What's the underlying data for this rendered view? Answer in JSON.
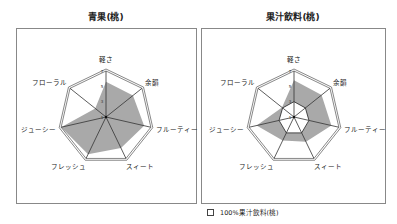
{
  "chart_data": [
    {
      "type": "radar",
      "title": "青果(桃)",
      "axes": [
        "軽さ",
        "余韻",
        "フルーティー",
        "スィート",
        "フレッシュ",
        "ジューシー",
        "フローラル"
      ],
      "scale_ticks": [
        "7",
        "5",
        "3",
        "1"
      ],
      "range": [
        1,
        7
      ],
      "series": [
        {
          "name": "青果(桃)",
          "fill": "#a9a9a9",
          "values": [
            5.6,
            5.5,
            6.1,
            5.5,
            6.4,
            7.0,
            2.8
          ]
        }
      ]
    },
    {
      "type": "radar",
      "title": "果汁飲料(桃)",
      "axes": [
        "軽さ",
        "余韻",
        "フルーティー",
        "スィート",
        "フレッシュ",
        "ジューシー",
        "フローラル"
      ],
      "scale_ticks": [
        "7",
        "5",
        "3",
        "1"
      ],
      "range": [
        1,
        7
      ],
      "series": [
        {
          "name": "果汁飲料(桃)",
          "fill": "#a9a9a9",
          "values": [
            5.8,
            5.6,
            6.0,
            4.6,
            4.4,
            6.0,
            3.0
          ]
        },
        {
          "name": "100%果汁飲料(桃)",
          "fill": "#ffffff",
          "values": [
            3.0,
            2.9,
            3.0,
            3.3,
            3.3,
            3.0,
            2.9
          ]
        }
      ]
    }
  ],
  "titles": {
    "left": "青果(桃)",
    "right": "果汁飲料(桃)"
  },
  "legend": {
    "label": "100%果汁飲料(桃)"
  }
}
